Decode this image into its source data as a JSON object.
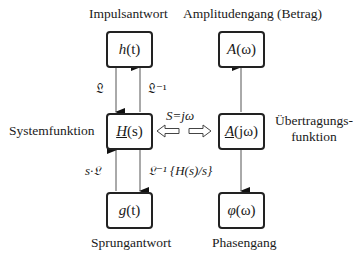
{
  "labels": {
    "impulse_response": "Impulsantwort",
    "amplitude_response": "Amplitudengang (Betrag)",
    "system_function": "Systemfunktion",
    "transfer_function_line1": "Übertragungs-",
    "transfer_function_line2": "funktion",
    "step_response": "Sprungantwort",
    "phase_response": "Phasengang"
  },
  "nodes": {
    "h": {
      "fn": "h",
      "arg": "(t)"
    },
    "H": {
      "fn": "H",
      "arg": "(s)"
    },
    "g": {
      "fn": "g",
      "arg": "(t)"
    },
    "A": {
      "fn": "A",
      "arg": "(ω)"
    },
    "Ajw": {
      "fn": "A",
      "arg": "(jω)"
    },
    "phi": {
      "fn": "φ",
      "arg": "(ω)"
    }
  },
  "edges": {
    "h_to_H": "𝔏",
    "H_to_h": "𝔏⁻¹",
    "g_to_H": "s·𝔏",
    "H_to_g": "𝔏⁻¹ {H(s)/s}",
    "substitution": "S=jω"
  }
}
